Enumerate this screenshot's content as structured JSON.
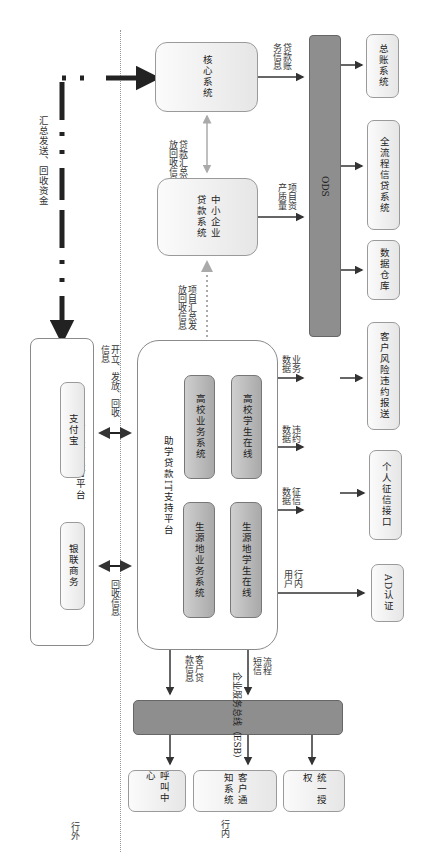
{
  "zones": {
    "outside_bank": "行外",
    "inside_bank": "行内"
  },
  "flows": {
    "summary_payment": "汇总发送、回收资金",
    "core_to_ods": "贷款账务信息",
    "core_sme_link": "贷款汇总发放回收信息",
    "sme_to_ods": "项目资产质量",
    "platform_to_sme": "项目汇总发放回收信息",
    "alipay_link": "开立、发放、回收信息",
    "unionpay_link": "回收信息",
    "business_data": "业务数据",
    "default_data": "违约数据",
    "credit_data": "征信数据",
    "internal_users": "行内用户",
    "customer_loan_info": "客户贷款信息",
    "sms_flow": "流程短信"
  },
  "systems": {
    "core": "核心系统",
    "sme_loan": "中小企业贷款系统",
    "ods": "ODS",
    "general_ledger": "总账系统",
    "full_credit": "全流程信贷系统",
    "data_warehouse": "数据仓库",
    "risk_report": "客户风险违约报送",
    "credit_interface": "个人征信接口",
    "ad_auth": "AD认证",
    "third_party": {
      "title": "第三方支付平台",
      "alipay": "支付宝",
      "unionpay": "银联商务"
    },
    "student_loan_platform": {
      "title": "助学贷款IT支持平台",
      "college_business": "高校业务系统",
      "college_student": "高校学生在线",
      "origin_business": "生源地业务系统",
      "origin_student": "生源地学生在线"
    },
    "esb": "企业服务总线（ESB）",
    "call_center": "呼叫中心",
    "customer_notify": "客户通知系统",
    "unified_auth": "统一授权"
  },
  "colors": {
    "bus": "#8e8e8e",
    "box_border": "#8a8a8a",
    "arrow": "#333333",
    "dotted_arrow": "#aaaaaa"
  }
}
